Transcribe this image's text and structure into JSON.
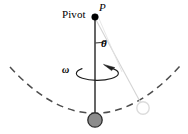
{
  "figure": {
    "name": "conical-pendulum-diagram",
    "type": "physics-diagram",
    "width": 188,
    "height": 134,
    "background_color": "#ffffff"
  },
  "labels": {
    "pivot_text": "Pivot",
    "point_p": "P",
    "angle_theta": "θ",
    "angular_velocity_omega": "ω"
  },
  "colors": {
    "stroke_dark": "#3a3a3a",
    "stroke_black": "#000000",
    "bob_fill": "#8c8c8c",
    "bob_stroke": "#2b2b2b",
    "dashed_arc": "#4d4d4d",
    "faint_line": "#d2d2d2",
    "ghost_bob_stroke": "#d9d9d9"
  },
  "geometry": {
    "pivot_point": {
      "x": 95,
      "y": 17,
      "radius": 3.2
    },
    "rod_top": {
      "x": 95,
      "y": 18
    },
    "rod_bottom": {
      "x": 95,
      "y": 120
    },
    "bob": {
      "x": 95,
      "y": 120,
      "radius": 7.2
    },
    "ghost_bob": {
      "x": 143,
      "y": 108,
      "radius": 6.2
    },
    "theta_arc": {
      "cx": 95,
      "cy": 17,
      "radius": 26,
      "start_deg": 90,
      "end_deg": 66
    },
    "rotation_ellipse": {
      "cx": 97,
      "cy": 73,
      "rx": 21,
      "ry": 7
    },
    "dashed_arc": {
      "cx": 95,
      "cy": 10,
      "radius": 110,
      "left_x": 10,
      "right_x": 180
    }
  },
  "elements": {
    "pivot_dot": "pivot-dot",
    "pendulum_rod": "pendulum-rod",
    "pendulum_bob": "pendulum-bob",
    "ghost_bob": "ghost-bob",
    "ghost_rod": "ghost-rod",
    "theta_arc": "theta-arc",
    "rotation_arrow": "rotation-arrow",
    "swing_path_arc": "swing-path-arc"
  }
}
